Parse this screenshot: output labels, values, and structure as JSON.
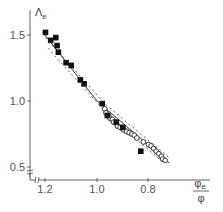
{
  "chart_data": {
    "type": "scatter",
    "title": "",
    "xlabel": "φe/φ",
    "ylabel": "Λe",
    "xlim": [
      1.26,
      0.56
    ],
    "ylim": [
      0.45,
      1.62
    ],
    "x_reversed": true,
    "x_ticks": [
      1.2,
      1.0,
      0.8
    ],
    "x_tick_labels": [
      "1.2",
      "1.0",
      "0.8"
    ],
    "y_ticks": [
      0.5,
      1.0,
      1.5
    ],
    "y_tick_labels": [
      "0.5",
      "1.0",
      "1.5"
    ],
    "grid": false,
    "legend": null,
    "axis_break_marks": true,
    "series": [
      {
        "name": "filled squares",
        "marker": "filled-square",
        "points": [
          [
            1.2,
            1.52
          ],
          [
            1.18,
            1.46
          ],
          [
            1.16,
            1.48
          ],
          [
            1.155,
            1.42
          ],
          [
            1.15,
            1.37
          ],
          [
            1.12,
            1.29
          ],
          [
            1.1,
            1.27
          ],
          [
            1.065,
            1.16
          ],
          [
            1.05,
            1.13
          ],
          [
            0.98,
            0.98
          ],
          [
            0.96,
            0.89
          ],
          [
            0.925,
            0.84
          ],
          [
            0.9,
            0.8
          ],
          [
            0.83,
            0.62
          ]
        ]
      },
      {
        "name": "open circles",
        "marker": "open-circle",
        "points": [
          [
            0.97,
            0.94
          ],
          [
            0.965,
            0.91
          ],
          [
            0.955,
            0.89
          ],
          [
            0.95,
            0.87
          ],
          [
            0.94,
            0.86
          ],
          [
            0.935,
            0.84
          ],
          [
            0.925,
            0.83
          ],
          [
            0.92,
            0.81
          ],
          [
            0.91,
            0.8
          ],
          [
            0.9,
            0.79
          ],
          [
            0.895,
            0.78
          ],
          [
            0.885,
            0.77
          ],
          [
            0.875,
            0.76
          ],
          [
            0.865,
            0.75
          ],
          [
            0.855,
            0.74
          ],
          [
            0.845,
            0.72
          ],
          [
            0.82,
            0.69
          ],
          [
            0.8,
            0.67
          ],
          [
            0.79,
            0.66
          ],
          [
            0.78,
            0.64
          ],
          [
            0.77,
            0.62
          ],
          [
            0.76,
            0.6
          ],
          [
            0.75,
            0.58
          ],
          [
            0.745,
            0.56
          ],
          [
            0.735,
            0.55
          ]
        ]
      },
      {
        "name": "solid fit line",
        "style": "solid",
        "points": [
          [
            1.21,
            1.52
          ],
          [
            1.0,
            1.0
          ],
          [
            0.72,
            0.53
          ]
        ]
      },
      {
        "name": "upper dashed bound",
        "style": "dashed",
        "points": [
          [
            1.2,
            1.48
          ],
          [
            0.97,
            0.98
          ],
          [
            0.72,
            0.57
          ]
        ]
      },
      {
        "name": "lower dashed bound",
        "style": "dashed",
        "points": [
          [
            1.19,
            1.4
          ],
          [
            0.95,
            0.88
          ],
          [
            0.74,
            0.53
          ]
        ]
      }
    ]
  },
  "labels": {
    "y_axis": "Λ",
    "y_axis_sub": "e",
    "x_axis_num": "φ",
    "x_axis_num_sub": "e",
    "x_axis_den": "φ",
    "x_ticks": [
      "1.2",
      "1.0",
      "0.8"
    ],
    "y_ticks": [
      "1.5",
      "1.0",
      "0.5"
    ]
  }
}
